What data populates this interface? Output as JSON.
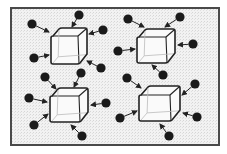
{
  "diagram": {
    "title": "",
    "frame": {
      "x": 11,
      "y": 8,
      "width": 208,
      "height": 137,
      "stroke": "#4a4a4a",
      "fill": "#ececec"
    },
    "colors": {
      "particle": "#1a1a1a",
      "cube_stroke": "#222222",
      "cube_fill": "#fafafa",
      "cube_inner": "#bbbbbb",
      "arrow": "#222222"
    },
    "cubes": [
      {
        "id": "cube-top-left",
        "x": 51,
        "y": 28,
        "w": 36,
        "h": 36
      },
      {
        "id": "cube-top-right",
        "x": 137,
        "y": 29,
        "w": 38,
        "h": 34
      },
      {
        "id": "cube-bottom-left",
        "x": 50,
        "y": 88,
        "w": 38,
        "h": 34
      },
      {
        "id": "cube-bottom-right",
        "x": 139,
        "y": 86,
        "w": 41,
        "h": 35
      }
    ],
    "particles": [
      {
        "cx": 32,
        "cy": 24,
        "tx": 49,
        "ty": 32
      },
      {
        "cx": 79,
        "cy": 15,
        "tx": 72,
        "ty": 27
      },
      {
        "cx": 103,
        "cy": 30,
        "tx": 89,
        "ty": 34
      },
      {
        "cx": 34,
        "cy": 58,
        "tx": 49,
        "ty": 55
      },
      {
        "cx": 101,
        "cy": 68,
        "tx": 87,
        "ty": 61
      },
      {
        "cx": 128,
        "cy": 19,
        "tx": 144,
        "ty": 27
      },
      {
        "cx": 180,
        "cy": 17,
        "tx": 165,
        "ty": 27
      },
      {
        "cx": 193,
        "cy": 44,
        "tx": 178,
        "ty": 45
      },
      {
        "cx": 118,
        "cy": 51,
        "tx": 135,
        "ty": 49
      },
      {
        "cx": 163,
        "cy": 75,
        "tx": 152,
        "ty": 65
      },
      {
        "cx": 45,
        "cy": 77,
        "tx": 56,
        "ty": 89
      },
      {
        "cx": 81,
        "cy": 73,
        "tx": 74,
        "ty": 87
      },
      {
        "cx": 29,
        "cy": 98,
        "tx": 47,
        "ty": 102
      },
      {
        "cx": 106,
        "cy": 103,
        "tx": 91,
        "ty": 105
      },
      {
        "cx": 34,
        "cy": 125,
        "tx": 48,
        "ty": 114
      },
      {
        "cx": 82,
        "cy": 136,
        "tx": 71,
        "ty": 125
      },
      {
        "cx": 127,
        "cy": 78,
        "tx": 141,
        "ty": 88
      },
      {
        "cx": 195,
        "cy": 84,
        "tx": 182,
        "ty": 95
      },
      {
        "cx": 120,
        "cy": 118,
        "tx": 137,
        "ty": 111
      },
      {
        "cx": 197,
        "cy": 117,
        "tx": 183,
        "ty": 113
      },
      {
        "cx": 169,
        "cy": 136,
        "tx": 160,
        "ty": 124
      }
    ]
  }
}
